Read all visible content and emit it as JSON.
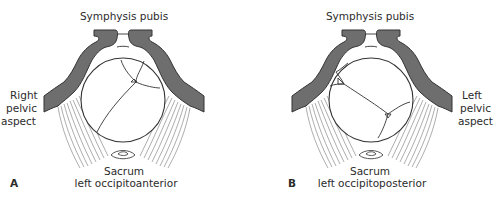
{
  "figure": {
    "panels": [
      {
        "letter": "A",
        "top_label": "Symphysis pubis",
        "side_label_lines": [
          "Right",
          "pelvic",
          "aspect"
        ],
        "side": "left",
        "bottom_label_line1": "Sacrum",
        "bottom_label_line2": "left occipitoanterior"
      },
      {
        "letter": "B",
        "top_label": "Symphysis pubis",
        "side_label_lines": [
          "Left",
          "pelvic",
          "aspect"
        ],
        "side": "right",
        "bottom_label_line1": "Sacrum",
        "bottom_label_line2": "left occipitoposterior"
      }
    ],
    "colors": {
      "bone": "#6e6e6e",
      "outline": "#333333",
      "ligament": "#8a8a8a",
      "text": "#2b2b2b"
    }
  }
}
